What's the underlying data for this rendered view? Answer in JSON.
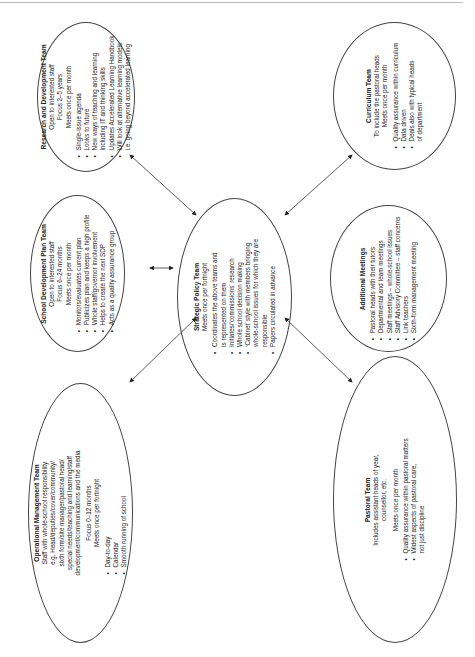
{
  "diagram": {
    "research": {
      "title": "Research and Development Team",
      "lines": [
        "Open to interested staff",
        "Focus 2–5 years",
        "Meets once per month"
      ],
      "bullets": [
        "Single-issue agenda",
        "Looks to future",
        "New ways of teaching and learning",
        "including IT and thinking skills",
        "Updates Accelerated Learning Handbook",
        "Will look at alternative learning models",
        "i.e. going beyond accelerated learning"
      ]
    },
    "curriculum": {
      "title": "Curriculum Team",
      "lines": [
        "To include the pastoral heads",
        "Meets once per month"
      ],
      "bullets": [
        "Quality assurance within curriculum",
        "Data driven",
        "Deals also with typical heads",
        "of department"
      ]
    },
    "sdp": {
      "title": "School Development Plan Team",
      "lines": [
        "Open to interested staff",
        "Focus 6–24 months",
        "Meets once per month"
      ],
      "bullets": [
        "Monitors/evaluates current plan",
        "Publicizes plan and keeps a high profile",
        "Whole staff/governor involvement",
        "Helps to create the next SDP",
        "Acts as a quality assurance group"
      ]
    },
    "strategic": {
      "title": "Strategic Policy Team",
      "lines": [
        "Meets once per fortnight"
      ],
      "bullets": [
        "Coordinates the above teams and",
        "is represented on them",
        "Initiates/‘commissions’ research",
        "Whole school decision making",
        "‘Cabinet’ style with members bringing",
        "whole-school issues for which they are",
        "responsible",
        "Papers circulated in advance"
      ]
    },
    "additional": {
      "title": "Additional Meetings",
      "bullets": [
        "Pastoral heads with their tutors",
        "Departmental and team meetings",
        "Staff meetings – whole-school issues",
        "Staff Advisory Committee – staff concerns",
        "Link teachers",
        "Sixth-form management meeting"
      ]
    },
    "operational": {
      "title": "Operational Management Team",
      "lines": [
        "Staff with whole-school responsibility",
        "e.g. Head/deputies/cover/community/",
        "sixth form/site manager/pastoral head/",
        "special needs/teaching and learning/staff",
        "development/communications and the media",
        "",
        "Focus 0–12 months",
        "Meets once per fortnight"
      ],
      "bullets": [
        "Day-to-day",
        "Calendar",
        "Smooth running of school"
      ]
    },
    "pastoral": {
      "title": "Pastoral Team",
      "lines": [
        "Includes assistant heads of year,",
        "counsellor, etc.",
        "",
        "Meets once per month"
      ],
      "bullets": [
        "Quality assurance within pastoral matters",
        "Widest aspects of pastoral care,",
        "not just discipline"
      ]
    }
  }
}
